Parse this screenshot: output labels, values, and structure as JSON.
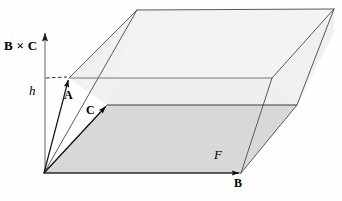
{
  "figure": {
    "type": "geometric-diagram",
    "canvas": {
      "width": 342,
      "height": 201
    },
    "colors": {
      "stroke": "#4a4a4a",
      "stroke_dark": "#2b2b2b",
      "base_fill": "#d9d9d9",
      "slab_fill": "#efefef",
      "top_fill": "#f2f2f2",
      "background": "#fefefe",
      "axis": "#808080"
    },
    "labels": {
      "cross_product": "B × C",
      "height": "h",
      "vector_a": "A",
      "vector_c": "C",
      "area_f": "F",
      "vector_b": "B"
    },
    "geometry": {
      "origin": [
        44,
        173
      ],
      "b_tip": [
        241,
        173
      ],
      "c_tip": [
        107,
        105
      ],
      "base_far": [
        297,
        105
      ],
      "a_tip": [
        69,
        78
      ],
      "slab_right": [
        272,
        78
      ],
      "top_left": [
        137,
        10
      ],
      "top_right": [
        334,
        9
      ],
      "axis_top": [
        45,
        28
      ],
      "axis_bottom": [
        45,
        173
      ],
      "dash_start": [
        47,
        78
      ],
      "dash_end": [
        66,
        78
      ]
    }
  }
}
